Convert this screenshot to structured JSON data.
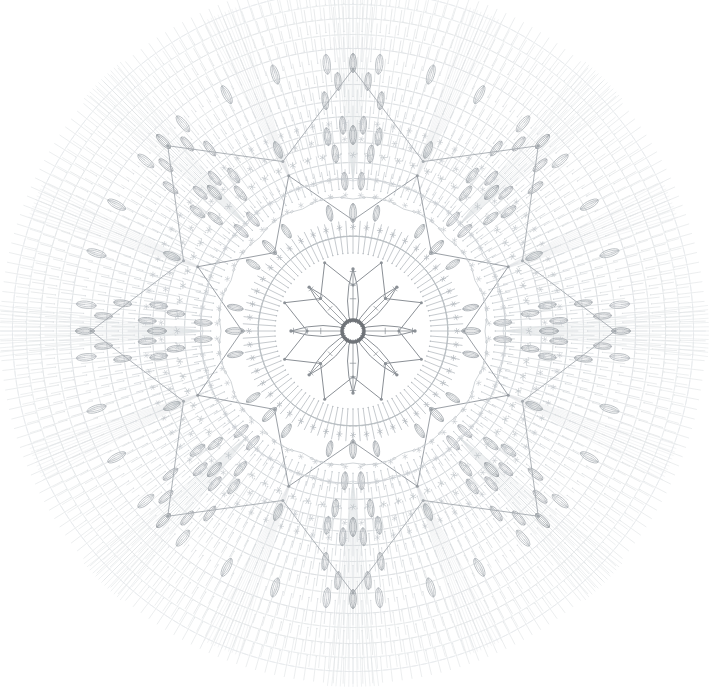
{
  "document": {
    "title": "Crochet Doily Pattern Chart",
    "type": "crochet-stitch-diagram",
    "background_color": "#ffffff",
    "width": 709,
    "height": 689
  },
  "chart_data": {
    "type": "diagram",
    "subtitle": "",
    "xlabel": "",
    "ylabel": "",
    "symmetry": "8-fold radial",
    "center": {
      "x": 353,
      "y": 331
    },
    "outer_radius": 356,
    "grid": false,
    "legend_position": "none",
    "annotations": [],
    "palette": {
      "ink_dark": "#6f7378",
      "ink_mid": "#9aa0a6",
      "ink_light": "#bfc5ca",
      "ink_faint": "#d8dcdf",
      "ink_ghost": "#e6e9eb",
      "background": "#ffffff"
    },
    "rounds": [
      {
        "index": 1,
        "name": "center-ring",
        "radius": 11,
        "stitch": "magic-ring",
        "count": 1,
        "color": "#6f7378"
      },
      {
        "index": 2,
        "name": "inner-petals",
        "radius": 62,
        "stitch": "petal-outline",
        "count": 8,
        "color": "#8b9096"
      },
      {
        "index": 3,
        "name": "inner-star",
        "radius": 74,
        "stitch": "star-outline",
        "count": 8,
        "color": "#8b9096"
      },
      {
        "index": 4,
        "name": "petal-fan-trebles",
        "radius": 96,
        "stitch": "treble",
        "count": 96,
        "color": "#b7bcc1"
      },
      {
        "index": 5,
        "name": "picot-ring-inner",
        "radius": 104,
        "stitch": "picot",
        "count": 48,
        "color": "#b0b6bb"
      },
      {
        "index": 6,
        "name": "puff-ring-inner",
        "radius": 120,
        "stitch": "puff",
        "count": 16,
        "color": "#a2a8ad"
      },
      {
        "index": 7,
        "name": "chain-arc-ring-a",
        "radius": 132,
        "stitch": "chain-arc",
        "count": 16,
        "color": "#c2c7cb"
      },
      {
        "index": 8,
        "name": "mid-star",
        "radius": 168,
        "stitch": "star-outline",
        "count": 8,
        "color": "#969ba1"
      },
      {
        "index": 9,
        "name": "treble-ring-b",
        "radius": 152,
        "stitch": "treble",
        "count": 128,
        "color": "#c8cdd1"
      },
      {
        "index": 10,
        "name": "picot-ring-mid",
        "radius": 176,
        "stitch": "picot",
        "count": 72,
        "color": "#bfc4c9"
      },
      {
        "index": 11,
        "name": "puff-ring-mid",
        "radius": 196,
        "stitch": "puff",
        "count": 24,
        "color": "#a8aeb3"
      },
      {
        "index": 12,
        "name": "outer-star",
        "radius": 262,
        "stitch": "star-outline",
        "count": 8,
        "color": "#a9aeb3"
      },
      {
        "index": 13,
        "name": "treble-ring-c",
        "radius": 214,
        "stitch": "treble",
        "count": 160,
        "color": "#d2d6d9"
      },
      {
        "index": 14,
        "name": "treble-ring-d",
        "radius": 246,
        "stitch": "treble",
        "count": 176,
        "color": "#d7dbde"
      },
      {
        "index": 15,
        "name": "puff-ring-outer",
        "radius": 268,
        "stitch": "puff",
        "count": 32,
        "color": "#b4b9be"
      },
      {
        "index": 16,
        "name": "treble-ring-e",
        "radius": 282,
        "stitch": "treble",
        "count": 192,
        "color": "#dde0e3"
      },
      {
        "index": 17,
        "name": "treble-ring-f",
        "radius": 312,
        "stitch": "treble",
        "count": 208,
        "color": "#e1e4e6"
      },
      {
        "index": 18,
        "name": "treble-ring-g",
        "radius": 340,
        "stitch": "treble",
        "count": 224,
        "color": "#e5e8ea"
      }
    ],
    "stitch_legend": [
      {
        "symbol": "ring",
        "name": "magic ring / chain ring"
      },
      {
        "symbol": "treble",
        "name": "treble crochet (vertical bar with crossbar)"
      },
      {
        "symbol": "picot",
        "name": "picot / star cluster"
      },
      {
        "symbol": "puff",
        "name": "puff stitch (lens / oval)"
      },
      {
        "symbol": "chain-arc",
        "name": "chain arc loop"
      },
      {
        "symbol": "shell",
        "name": "fan / shell cluster"
      }
    ]
  }
}
